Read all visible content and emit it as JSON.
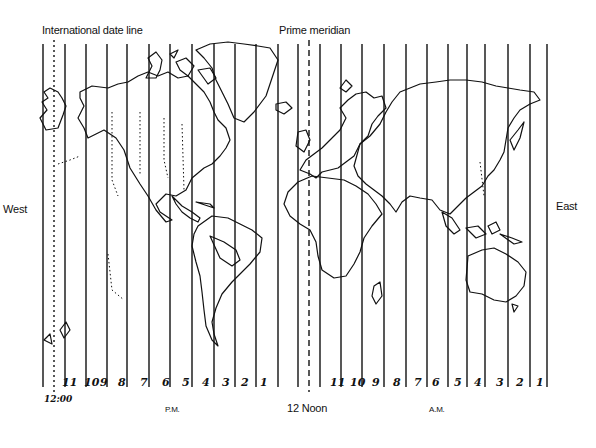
{
  "labels": {
    "date_line": "International date line",
    "prime_meridian": "Prime meridian",
    "west": "West",
    "east": "East",
    "pm": "P.M.",
    "noon": "12 Noon",
    "am": "A.M.",
    "midnight": "12:00"
  },
  "pm_hours": [
    "11",
    "10",
    "9",
    "8",
    "7",
    "6",
    "5",
    "4",
    "3",
    "2",
    "1"
  ],
  "am_hours": [
    "11",
    "10",
    "9",
    "8",
    "7",
    "6",
    "5",
    "4",
    "3",
    "2",
    "1"
  ],
  "pm_hour_x": [
    62,
    84,
    100,
    118,
    140,
    162,
    182,
    202,
    222,
    241,
    260
  ],
  "am_hour_x": [
    330,
    350,
    372,
    393,
    414,
    432,
    454,
    474,
    496,
    516,
    536
  ],
  "meridian_lines_x": [
    43,
    65,
    86,
    107,
    127,
    149,
    170,
    192,
    214,
    235,
    256,
    278,
    298,
    320,
    341,
    362,
    384,
    406,
    427,
    448,
    467,
    485,
    508,
    530,
    547
  ],
  "date_line_x": 54,
  "prime_meridian_x": 309,
  "colors": {
    "ink": "#111111",
    "background": "#ffffff"
  }
}
